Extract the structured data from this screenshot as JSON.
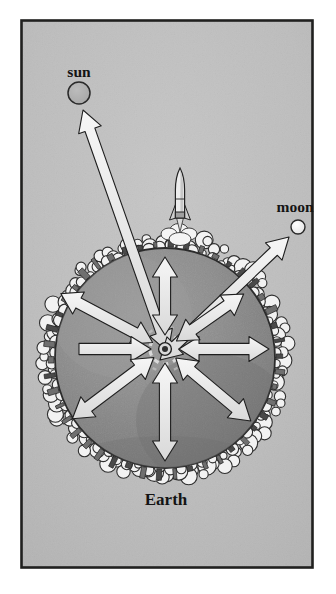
{
  "figure": {
    "title_alt": "Diagram of gravitational forces acting on Earth, with arrows to the sun and the moon",
    "border_color": "#20201f",
    "background_color": "#bfbfbf",
    "paper_color": "#ffffff"
  },
  "labels": {
    "sun": "sun",
    "moon": "moon",
    "earth": "Earth"
  },
  "bodies": [
    {
      "id": "sun",
      "name": "sun",
      "label": "sun",
      "cx": 79,
      "cy": 93,
      "r": 11,
      "fill": "#b2b2b2",
      "stroke": "#2a2a2a",
      "label_x": 79,
      "label_y": 76
    },
    {
      "id": "moon",
      "name": "moon",
      "label": "moon",
      "cx": 298,
      "cy": 227,
      "r": 7,
      "fill": "#f2f2f2",
      "stroke": "#2a2a2a",
      "label_x": 295,
      "label_y": 212
    },
    {
      "id": "earth",
      "name": "earth",
      "label": "Earth",
      "cx": 165,
      "cy": 358,
      "r": 110,
      "fill": "#8c8c8c",
      "stroke": "#2b2b2b",
      "label_x": 166,
      "label_y": 504
    }
  ],
  "core": {
    "name": "earth-core",
    "cx": 165,
    "cy": 349,
    "ring_r": 4.2,
    "dashed_r": 15,
    "fill": "#3a3a3a"
  },
  "rocket": {
    "name": "rocket",
    "x": 180,
    "y": 168,
    "color": "#e9e9e9",
    "outline": "#232323"
  },
  "arrow_style": {
    "fill": "#ededed",
    "stroke": "#1e1e1e",
    "stroke_width": 1.1
  },
  "chart_data": {
    "type": "diagram",
    "center": [
      165,
      349
    ],
    "radial_arrows": [
      {
        "name": "arrow-up",
        "angle_deg": 270,
        "length": 92,
        "double": true
      },
      {
        "name": "arrow-upper-left",
        "angle_deg": 208,
        "length": 118,
        "double": true
      },
      {
        "name": "arrow-left",
        "angle_deg": 180,
        "length": 86,
        "double": false
      },
      {
        "name": "arrow-lower-left",
        "angle_deg": 143,
        "length": 116,
        "double": true
      },
      {
        "name": "arrow-down",
        "angle_deg": 90,
        "length": 112,
        "double": true
      },
      {
        "name": "arrow-lower-right",
        "angle_deg": 40,
        "length": 112,
        "double": true
      },
      {
        "name": "arrow-right",
        "angle_deg": 0,
        "length": 104,
        "double": true
      },
      {
        "name": "arrow-upper-right",
        "angle_deg": 325,
        "length": 96,
        "double": true
      }
    ],
    "long_arrows": [
      {
        "name": "arrow-to-sun",
        "from": [
          168,
          352
        ],
        "to": [
          83,
          110
        ],
        "double": true,
        "target": "sun"
      },
      {
        "name": "arrow-to-moon",
        "from": [
          160,
          360
        ],
        "to": [
          289,
          237
        ],
        "double": true,
        "target": "moon"
      }
    ]
  }
}
